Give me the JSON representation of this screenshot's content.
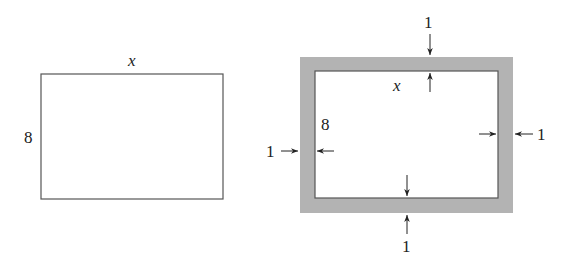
{
  "colors": {
    "background": "#ffffff",
    "line": "#555555",
    "border_fill": "#b3b3b3",
    "text": "#222222"
  },
  "figure_left": {
    "description": "Plain rectangle",
    "width_label": "x",
    "height_label": "8"
  },
  "figure_right": {
    "description": "Rectangle surrounded by a shaded uniform border",
    "inner_width_label": "x",
    "inner_height_label": "8",
    "border_width_labels": {
      "top": "1",
      "bottom": "1",
      "left": "1",
      "right": "1"
    }
  }
}
